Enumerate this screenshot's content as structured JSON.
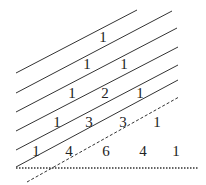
{
  "diagram": {
    "colors": {
      "line": "#333333",
      "text": "#222222",
      "background": "#ffffff"
    },
    "rows": [
      {
        "values": [
          "1"
        ],
        "positions": [
          [
            103,
            37
          ]
        ]
      },
      {
        "values": [
          "1",
          "1"
        ],
        "positions": [
          [
            87,
            64
          ],
          [
            124,
            64
          ]
        ]
      },
      {
        "values": [
          "1",
          "2",
          "1"
        ],
        "positions": [
          [
            72,
            93
          ],
          [
            105,
            93
          ],
          [
            140,
            93
          ]
        ]
      },
      {
        "values": [
          "1",
          "3",
          "3",
          "1"
        ],
        "positions": [
          [
            57,
            122
          ],
          [
            89,
            122
          ],
          [
            123,
            122
          ],
          [
            157,
            122
          ]
        ]
      },
      {
        "values": [
          "1",
          "4",
          "6",
          "4",
          "1"
        ],
        "positions": [
          [
            36,
            151
          ],
          [
            69,
            151
          ],
          [
            106,
            151
          ],
          [
            143,
            151
          ],
          [
            176,
            151
          ]
        ]
      }
    ],
    "solid_lines": [
      [
        16,
        73,
        137,
        10
      ],
      [
        16,
        93,
        172,
        11
      ],
      [
        16,
        112,
        177,
        28
      ],
      [
        16,
        131,
        178,
        47
      ],
      [
        16,
        150,
        178,
        65
      ],
      [
        16,
        167,
        178,
        80
      ]
    ],
    "dashed_line": [
      27,
      182,
      179,
      97
    ],
    "dotted_line": [
      16,
      168,
      198,
      168
    ]
  }
}
